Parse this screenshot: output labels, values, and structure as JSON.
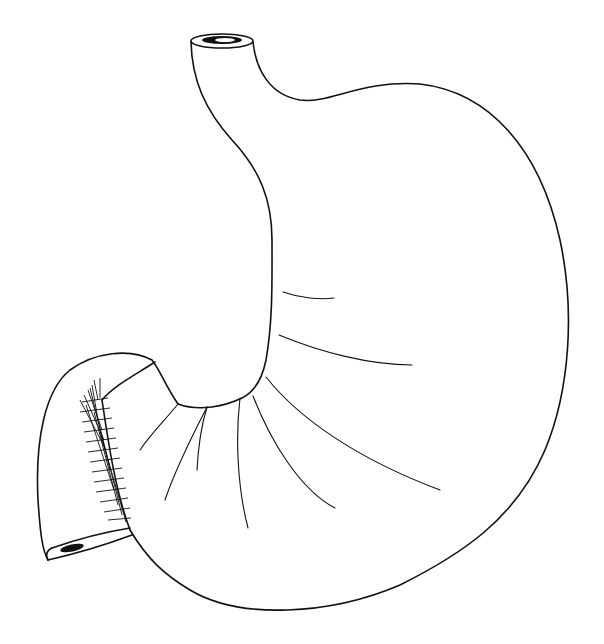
{
  "illustration": {
    "subject": "stomach",
    "style": "black ink line drawing on white",
    "colors": {
      "stroke": "#111111",
      "background": "#ffffff"
    },
    "parts": [
      "esophagus-opening",
      "fundus-greater-curvature",
      "lesser-curvature",
      "body-folds",
      "pyloric-antrum",
      "duodenum-opening",
      "hatched-pyloric-sphincter"
    ]
  }
}
